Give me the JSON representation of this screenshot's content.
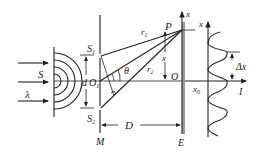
{
  "diagram": {
    "labels": {
      "source": "S",
      "wavelength": "λ",
      "slit1": "S",
      "slit1_sub": "1",
      "slit2": "S",
      "slit2_sub": "2",
      "slit_separation": "d",
      "midpoint": "O",
      "midpoint_sub": "1",
      "angle": "θ",
      "path1": "r",
      "path1_sub": "1",
      "path2": "r",
      "path2_sub": "2",
      "point": "P",
      "origin": "O",
      "screen_axis": "x",
      "position": "x",
      "distance": "D",
      "slit_screen": "M",
      "observation_screen": "E",
      "graph_axis": "x",
      "graph_origin": "x",
      "graph_origin_sub": "0",
      "intensity": "I",
      "fringe_spacing": "Δx"
    },
    "colors": {
      "line": "#222222",
      "screen_band": "#9a9a9a",
      "background": "#ffffff"
    }
  }
}
